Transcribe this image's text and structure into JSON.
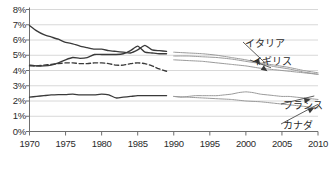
{
  "chart_data": {
    "type": "line",
    "title": "",
    "xlabel": "",
    "ylabel": "",
    "xlim": [
      1970,
      2010
    ],
    "ylim": [
      0,
      8
    ],
    "grid": true,
    "legend_position": "inline-annotations",
    "y_tick_labels": [
      "8%",
      "7%",
      "6%",
      "5%",
      "4%",
      "3%",
      "2%",
      "1%",
      "0%"
    ],
    "y_ticks": [
      8,
      7,
      6,
      5,
      4,
      3,
      2,
      1,
      0
    ],
    "x_tick_labels": [
      "1970",
      "1975",
      "1980",
      "1985",
      "1990",
      "1995",
      "2000",
      "2005",
      "2010"
    ],
    "x_ticks": [
      1970,
      1975,
      1980,
      1985,
      1990,
      1995,
      2000,
      2005,
      2010
    ],
    "annotations": [
      {
        "name": "イタリア",
        "target_x": 2002,
        "target_y": 4.35,
        "label_x": 245,
        "label_y": 42
      },
      {
        "name": "イギリス",
        "target_x": 2003,
        "target_y": 3.95,
        "label_x": 252,
        "label_y": 60
      },
      {
        "name": "フランス",
        "target_x": 2009,
        "target_y": 2.1,
        "label_x": 283,
        "label_y": 104
      },
      {
        "name": "カナダ",
        "target_x": 2009.5,
        "target_y": 1.55,
        "label_x": 283,
        "label_y": 124
      }
    ],
    "series": [
      {
        "name": "イタリア",
        "style": "solid",
        "color": "#3a3a3a",
        "segment": "early",
        "x": [
          1970,
          1971,
          1972,
          1973,
          1974,
          1975,
          1976,
          1977,
          1978,
          1979,
          1980,
          1981,
          1982,
          1983,
          1984,
          1985,
          1986,
          1987,
          1988,
          1989
        ],
        "values": [
          6.95,
          6.6,
          6.35,
          6.2,
          6.05,
          5.85,
          5.75,
          5.6,
          5.5,
          5.4,
          5.4,
          5.3,
          5.25,
          5.2,
          5.15,
          5.35,
          5.65,
          5.35,
          5.3,
          5.25
        ]
      },
      {
        "name": "イギリス",
        "style": "solid",
        "color": "#3a3a3a",
        "segment": "early",
        "x": [
          1970,
          1971,
          1972,
          1973,
          1974,
          1975,
          1976,
          1977,
          1978,
          1979,
          1980,
          1981,
          1982,
          1983,
          1984,
          1985,
          1986,
          1987,
          1988,
          1989
        ],
        "values": [
          4.35,
          4.3,
          4.3,
          4.35,
          4.5,
          4.7,
          4.85,
          4.8,
          4.85,
          5.05,
          5.05,
          5.05,
          5.05,
          5.1,
          5.3,
          5.6,
          5.2,
          5.15,
          5.1,
          5.1
        ]
      },
      {
        "name": "フランス",
        "style": "dashed",
        "color": "#3a3a3a",
        "segment": "early",
        "x": [
          1970,
          1971,
          1972,
          1973,
          1974,
          1975,
          1976,
          1977,
          1978,
          1979,
          1980,
          1981,
          1982,
          1983,
          1984,
          1985,
          1986,
          1987,
          1988,
          1989
        ],
        "values": [
          4.3,
          4.3,
          4.35,
          4.4,
          4.45,
          4.5,
          4.5,
          4.45,
          4.45,
          4.5,
          4.5,
          4.45,
          4.35,
          4.35,
          4.45,
          4.5,
          4.45,
          4.3,
          4.1,
          3.95
        ]
      },
      {
        "name": "カナダ",
        "style": "solid",
        "color": "#3a3a3a",
        "segment": "early",
        "x": [
          1970,
          1971,
          1972,
          1973,
          1974,
          1975,
          1976,
          1977,
          1978,
          1979,
          1980,
          1981,
          1982,
          1983,
          1984,
          1985,
          1986,
          1987,
          1988,
          1989
        ],
        "values": [
          2.25,
          2.3,
          2.35,
          2.4,
          2.42,
          2.42,
          2.45,
          2.4,
          2.4,
          2.4,
          2.45,
          2.4,
          2.2,
          2.25,
          2.3,
          2.35,
          2.35,
          2.35,
          2.35,
          2.35
        ]
      },
      {
        "name": "イタリア",
        "style": "solid",
        "color": "#9a9a9a",
        "segment": "late",
        "x": [
          1990,
          1992,
          1994,
          1996,
          1998,
          2000,
          2002,
          2004,
          2006,
          2008,
          2010
        ],
        "values": [
          5.2,
          5.15,
          5.1,
          5.0,
          4.85,
          4.7,
          4.5,
          4.35,
          4.2,
          4.0,
          3.85
        ]
      },
      {
        "name": "イギリス",
        "style": "solid",
        "color": "#9a9a9a",
        "segment": "late",
        "x": [
          1990,
          1992,
          1994,
          1996,
          1998,
          2000,
          2002,
          2004,
          2006,
          2008,
          2010
        ],
        "values": [
          4.95,
          4.95,
          4.9,
          4.85,
          4.75,
          4.6,
          4.45,
          4.25,
          4.1,
          3.9,
          3.75
        ]
      },
      {
        "name": "フランス-late-upper",
        "style": "solid",
        "color": "#9a9a9a",
        "segment": "late",
        "x": [
          1990,
          1992,
          1994,
          1996,
          1998,
          2000,
          2002,
          2004,
          2006,
          2008,
          2010
        ],
        "values": [
          4.7,
          4.65,
          4.6,
          4.5,
          4.4,
          4.3,
          4.15,
          4.05,
          3.95,
          3.85,
          3.75
        ]
      },
      {
        "name": "フランス",
        "style": "solid",
        "color": "#9a9a9a",
        "segment": "late",
        "x": [
          1990,
          1991,
          1992,
          1993,
          1994,
          1995,
          1996,
          1997,
          1998,
          1999,
          2000,
          2001,
          2002,
          2003,
          2004,
          2005,
          2006,
          2007,
          2008,
          2009,
          2010
        ],
        "values": [
          2.3,
          2.25,
          2.3,
          2.35,
          2.35,
          2.35,
          2.35,
          2.4,
          2.45,
          2.55,
          2.6,
          2.55,
          2.45,
          2.4,
          2.35,
          2.3,
          2.3,
          2.25,
          2.2,
          2.15,
          2.1
        ]
      },
      {
        "name": "カナダ",
        "style": "solid",
        "color": "#9a9a9a",
        "segment": "late",
        "x": [
          1990,
          1992,
          1994,
          1996,
          1998,
          2000,
          2002,
          2004,
          2006,
          2008,
          2010
        ],
        "values": [
          2.3,
          2.25,
          2.2,
          2.15,
          2.1,
          2.0,
          1.95,
          1.85,
          1.75,
          1.65,
          1.55
        ]
      }
    ]
  }
}
